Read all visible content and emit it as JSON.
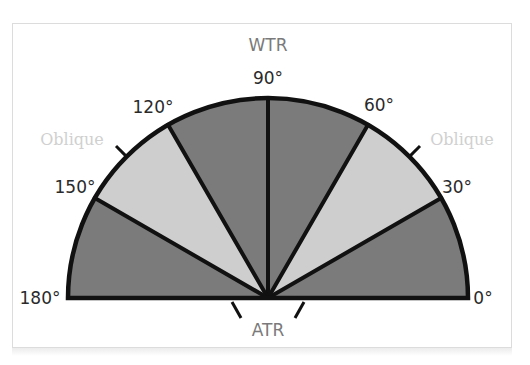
{
  "diagram": {
    "colors": {
      "dark_sector": "#7b7b7b",
      "light_sector": "#cecece",
      "outline": "#111111",
      "label": "#2a2a2a",
      "category_label": "#7a7a7a",
      "oblique_label": "#cfcfcf"
    },
    "angle_labels": {
      "a0": "0°",
      "a30": "30°",
      "a60": "60°",
      "a90": "90°",
      "a120": "120°",
      "a150": "150°",
      "a180": "180°"
    },
    "categories": {
      "wtr": "WTR",
      "atr": "ATR",
      "oblique_left": "Oblique",
      "oblique_right": "Oblique"
    },
    "sectors": [
      {
        "from": 0,
        "to": 30,
        "shade": "dark",
        "category": "ATR"
      },
      {
        "from": 30,
        "to": 60,
        "shade": "light",
        "category": "Oblique"
      },
      {
        "from": 60,
        "to": 90,
        "shade": "dark",
        "category": "WTR"
      },
      {
        "from": 90,
        "to": 120,
        "shade": "dark",
        "category": "WTR"
      },
      {
        "from": 120,
        "to": 150,
        "shade": "light",
        "category": "Oblique"
      },
      {
        "from": 150,
        "to": 180,
        "shade": "dark",
        "category": "ATR"
      }
    ]
  }
}
